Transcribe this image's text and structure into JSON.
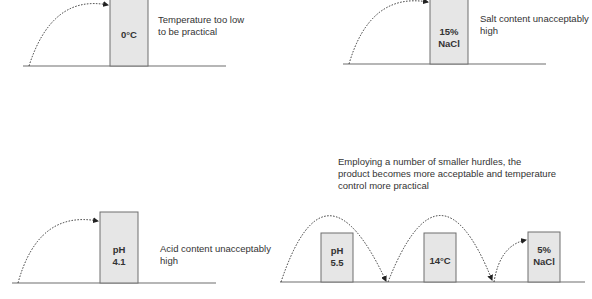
{
  "panels": [
    {
      "id": "temperature",
      "hurdle_label_lines": [
        "0°C"
      ],
      "description_lines": [
        "Temperature too low",
        "to be practical"
      ]
    },
    {
      "id": "salt",
      "hurdle_label_lines": [
        "15%",
        "NaCl"
      ],
      "description_lines": [
        "Salt content unacceptably",
        "high"
      ]
    },
    {
      "id": "acid",
      "hurdle_label_lines": [
        "pH",
        "4.1"
      ],
      "description_lines": [
        "Acid content unacceptably",
        "high"
      ]
    },
    {
      "id": "combined",
      "caption_lines": [
        "Employing a number of smaller hurdles, the",
        "product becomes more acceptable and temperature",
        "control more practical"
      ],
      "hurdles": [
        {
          "label_lines": [
            "pH",
            "5.5"
          ]
        },
        {
          "label_lines": [
            "14°C"
          ]
        },
        {
          "label_lines": [
            "5%",
            "NaCl"
          ]
        }
      ]
    }
  ],
  "colors": {
    "bar_fill": "#e6e6e6",
    "bar_stroke": "#6e6e6e",
    "ground": "#6e6e6e",
    "arc": "#333333",
    "text": "#333333"
  }
}
